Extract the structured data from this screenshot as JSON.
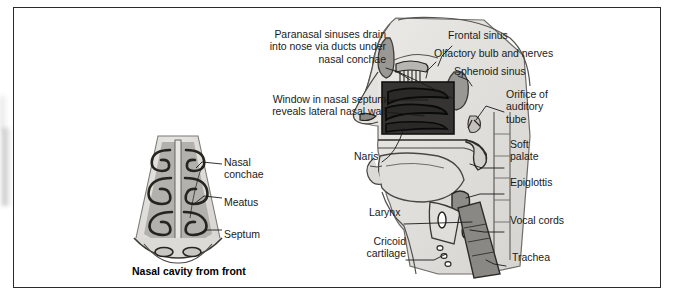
{
  "figure": {
    "title_caption": "Nasal cavity from front",
    "left_panel": {
      "name": "coronal-nasal-cavity",
      "labels": [
        {
          "id": "nasal-conchae",
          "text": "Nasal\nconchae"
        },
        {
          "id": "meatus",
          "text": "Meatus"
        },
        {
          "id": "septum",
          "text": "Septum"
        }
      ]
    },
    "right_panel": {
      "name": "sagittal-head-section",
      "labels": [
        {
          "id": "paranasal-sinuses",
          "text": "Paranasal sinuses drain\ninto nose via ducts under\nnasal conchae"
        },
        {
          "id": "window-nasal-septum",
          "text": "Window in nasal septum\nreveals lateral nasal wall"
        },
        {
          "id": "frontal-sinus",
          "text": "Frontal sinus"
        },
        {
          "id": "olfactory-bulb",
          "text": "Olfactory bulb and nerves"
        },
        {
          "id": "sphenoid-sinus",
          "text": "Sphenoid sinus"
        },
        {
          "id": "orifice-auditory-tube",
          "text": "Orifice of\nauditory\ntube"
        },
        {
          "id": "naris",
          "text": "Naris"
        },
        {
          "id": "soft-palate",
          "text": "Soft\npalate"
        },
        {
          "id": "epiglottis",
          "text": "Epiglottis"
        },
        {
          "id": "larynx",
          "text": "Larynx"
        },
        {
          "id": "vocal-cords",
          "text": "Vocal cords"
        },
        {
          "id": "cricoid-cartilage",
          "text": "Cricoid\ncartilage"
        },
        {
          "id": "trachea",
          "text": "Trachea"
        }
      ]
    },
    "colors": {
      "ink": "#1a1a1a",
      "frame": "#2b2b2b",
      "tissue_light": "#e2e0dc",
      "tissue_mid": "#b9b7b3",
      "tissue_dark": "#8e8c88",
      "window_dark": "#3a3a3a",
      "background": "#ffffff"
    }
  }
}
